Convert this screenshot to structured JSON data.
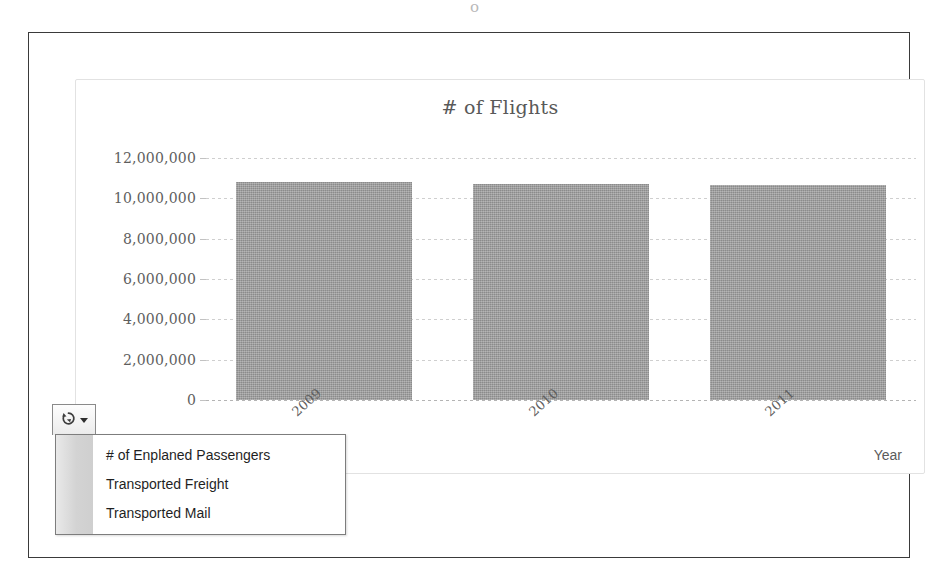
{
  "chart_data": {
    "type": "bar",
    "title": "# of Flights",
    "xlabel": "Year",
    "ylabel": "",
    "categories": [
      "2009",
      "2010",
      "2011"
    ],
    "values": [
      10800000,
      10700000,
      10650000
    ],
    "ylim": [
      0,
      12000000
    ],
    "ytick_labels": [
      "12,000,000",
      "10,000,000",
      "8,000,000",
      "6,000,000",
      "4,000,000",
      "2,000,000",
      "0"
    ],
    "ytick_values": [
      12000000,
      10000000,
      8000000,
      6000000,
      4000000,
      2000000,
      0
    ],
    "grid": true,
    "legend": "none",
    "bar_color": "#989898",
    "series_name": "# of Flights"
  },
  "toolbar": {
    "series_button_icon": "refresh-cycle-icon",
    "caret_icon": "caret-down-icon"
  },
  "series_menu": {
    "items": [
      {
        "label": "# of Enplaned Passengers"
      },
      {
        "label": "Transported Freight"
      },
      {
        "label": "Transported Mail"
      }
    ]
  },
  "artifact": {
    "mark": "o"
  }
}
